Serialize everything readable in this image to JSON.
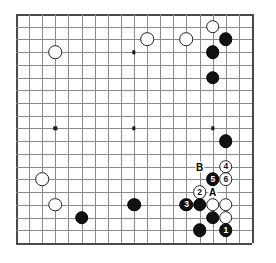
{
  "diagram": {
    "board_size": 19,
    "geometry": {
      "origin_x": 16,
      "origin_y": 14,
      "step_x": 13.11,
      "step_y": 12.72,
      "stone_diameter": 13.6
    },
    "colors": {
      "board_background": "#ffffff",
      "grid_line": "#8a8a8a",
      "board_edge": "#4a4a4a",
      "black_stone": "#111111",
      "white_stone": "#ffffff",
      "black_label_text": "#ffffff",
      "white_label_text": "#111111",
      "marker_text": "#000000"
    },
    "star_points": [
      {
        "col": 3,
        "row": 3
      },
      {
        "col": 9,
        "row": 3
      },
      {
        "col": 15,
        "row": 3
      },
      {
        "col": 3,
        "row": 9
      },
      {
        "col": 9,
        "row": 9
      },
      {
        "col": 15,
        "row": 9
      },
      {
        "col": 3,
        "row": 15
      },
      {
        "col": 9,
        "row": 15
      },
      {
        "col": 15,
        "row": 15
      }
    ],
    "stones": [
      {
        "col": 3,
        "row": 3,
        "color": "white",
        "label": ""
      },
      {
        "col": 10,
        "row": 2,
        "color": "white",
        "label": ""
      },
      {
        "col": 13,
        "row": 2,
        "color": "white",
        "label": ""
      },
      {
        "col": 15,
        "row": 1,
        "color": "white",
        "label": ""
      },
      {
        "col": 16,
        "row": 2,
        "color": "black",
        "label": ""
      },
      {
        "col": 15,
        "row": 3,
        "color": "black",
        "label": ""
      },
      {
        "col": 15,
        "row": 5,
        "color": "black",
        "label": ""
      },
      {
        "col": 16,
        "row": 10,
        "color": "black",
        "label": ""
      },
      {
        "col": 2,
        "row": 13,
        "color": "white",
        "label": ""
      },
      {
        "col": 3,
        "row": 15,
        "color": "white",
        "label": ""
      },
      {
        "col": 5,
        "row": 16,
        "color": "black",
        "label": ""
      },
      {
        "col": 9,
        "row": 15,
        "color": "black",
        "label": ""
      },
      {
        "col": 16,
        "row": 12,
        "color": "white",
        "label": "4"
      },
      {
        "col": 15,
        "row": 13,
        "color": "black",
        "label": "5"
      },
      {
        "col": 16,
        "row": 13,
        "color": "white",
        "label": "6"
      },
      {
        "col": 14,
        "row": 14,
        "color": "white",
        "label": "2"
      },
      {
        "col": 13,
        "row": 15,
        "color": "black",
        "label": "3"
      },
      {
        "col": 14,
        "row": 15,
        "color": "black",
        "label": ""
      },
      {
        "col": 15,
        "row": 15,
        "color": "white",
        "label": ""
      },
      {
        "col": 16,
        "row": 15,
        "color": "white",
        "label": ""
      },
      {
        "col": 15,
        "row": 16,
        "color": "black",
        "label": ""
      },
      {
        "col": 16,
        "row": 16,
        "color": "white",
        "label": ""
      },
      {
        "col": 14,
        "row": 17,
        "color": "black",
        "label": ""
      },
      {
        "col": 16,
        "row": 17,
        "color": "black",
        "label": "1"
      }
    ],
    "markers": [
      {
        "col": 14,
        "row": 12,
        "text": "B"
      },
      {
        "col": 15,
        "row": 14,
        "text": "A"
      }
    ],
    "move_sequence": [
      "1",
      "2",
      "3",
      "4",
      "5",
      "6"
    ]
  }
}
